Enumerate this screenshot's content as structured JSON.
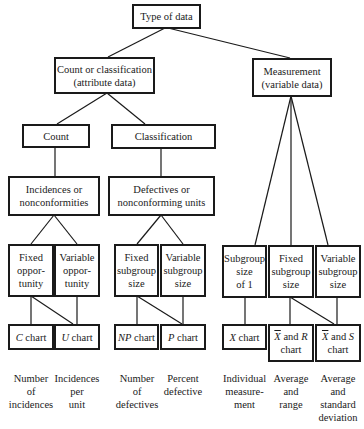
{
  "root": {
    "label": "Type of data"
  },
  "attribute": {
    "line1": "Count or classification",
    "line2": "(attribute data)"
  },
  "variable": {
    "line1": "Measurement",
    "line2": "(variable data)"
  },
  "count": {
    "label": "Count"
  },
  "classification": {
    "label": "Classification"
  },
  "incidences": {
    "line1": "Incidences or",
    "line2": "nonconformities"
  },
  "defectives": {
    "line1": "Defectives or",
    "line2": "nonconforming units"
  },
  "leaves": {
    "fixed_opp": {
      "l1": "Fixed",
      "l2": "oppor-",
      "l3": "tunity"
    },
    "var_opp": {
      "l1": "Variable",
      "l2": "oppor-",
      "l3": "tunity"
    },
    "fixed_sub_attr": {
      "l1": "Fixed",
      "l2": "subgroup",
      "l3": "size"
    },
    "var_sub_attr": {
      "l1": "Variable",
      "l2": "subgroup",
      "l3": "size"
    },
    "sub_one": {
      "l1": "Subgroup",
      "l2": "size",
      "l3": "of 1"
    },
    "fixed_sub_var": {
      "l1": "Fixed",
      "l2": "subgroup",
      "l3": "size"
    },
    "var_sub_var": {
      "l1": "Variable",
      "l2": "subgroup",
      "l3": "size"
    }
  },
  "charts": {
    "c": {
      "sym": "C",
      "rest": " chart"
    },
    "u": {
      "sym": "U",
      "rest": " chart"
    },
    "np": {
      "sym": "NP",
      "rest": " chart"
    },
    "p": {
      "sym": "P",
      "rest": " chart"
    },
    "x": {
      "sym": "X",
      "rest": " chart"
    },
    "xr": {
      "sym": "X",
      "mid": " and ",
      "sym2": "R",
      "l2": "chart"
    },
    "xs": {
      "sym": "X",
      "mid": " and ",
      "sym2": "S",
      "l2": "chart"
    }
  },
  "captions": {
    "c": [
      "Number",
      "of",
      "incidences"
    ],
    "u": [
      "Incidences",
      "per",
      "unit"
    ],
    "np": [
      "Number",
      "of",
      "defectives"
    ],
    "p": [
      "Percent",
      "defective"
    ],
    "x": [
      "Individual",
      "measure-",
      "ment"
    ],
    "xr": [
      "Average",
      "and",
      "range"
    ],
    "xs": [
      "Average",
      "and",
      "standard",
      "deviation"
    ]
  }
}
